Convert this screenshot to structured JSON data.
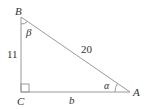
{
  "diagram": {
    "type": "right-triangle",
    "vertices": {
      "B": {
        "label": "B",
        "x": 21,
        "y": 17
      },
      "C": {
        "label": "C",
        "x": 21,
        "y": 92
      },
      "A": {
        "label": "A",
        "x": 130,
        "y": 92
      }
    },
    "sides": {
      "BC": "11",
      "BA": "20",
      "CA": "b"
    },
    "angles": {
      "at_A": "α",
      "at_B": "β",
      "at_C": "right-angle"
    },
    "colors": {
      "line": "#999999",
      "text": "#333333"
    }
  }
}
